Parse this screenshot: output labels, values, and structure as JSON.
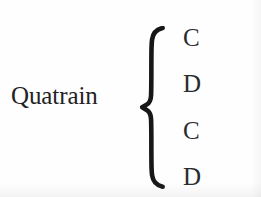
{
  "figure": {
    "kind": "rhyme-scheme-diagram",
    "term": "Quatrain",
    "grouping_symbol": "left-curly-brace",
    "rhyme_scheme": [
      "C",
      "D",
      "C",
      "D"
    ],
    "colors": {
      "background": "#fefefe",
      "ink": "#262629",
      "brace_ink": "#17171a"
    }
  }
}
